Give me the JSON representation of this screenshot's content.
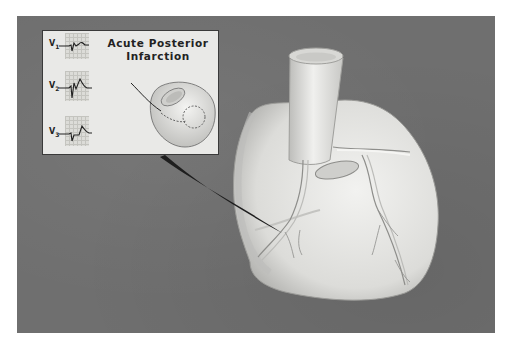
{
  "figure": {
    "inset": {
      "title_line1": "Acute Posterior",
      "title_line2": "Infarction",
      "leads": [
        {
          "label": "V",
          "sub": "1"
        },
        {
          "label": "V",
          "sub": "2"
        },
        {
          "label": "V",
          "sub": "3"
        }
      ]
    },
    "colors": {
      "background": "#6f6f6f",
      "inset_background": "#e9e9e7",
      "heart": "#e6e6e4",
      "pointer": "#1e1e1e"
    }
  }
}
